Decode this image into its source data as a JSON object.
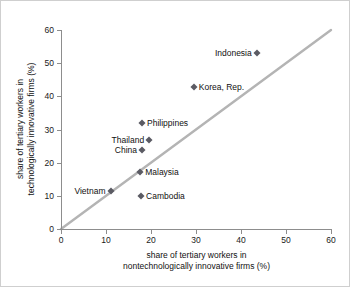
{
  "chart_data": {
    "type": "scatter",
    "title": "",
    "xlabel": "share of tertiary workers in nontechnologically innovative firms (%)",
    "xlabel_lines": [
      "share of tertiary workers in",
      "nontechnologically innovative firms (%)"
    ],
    "ylabel": "share of tertiary workers in technologically innovative firms (%)",
    "ylabel_lines": [
      "share of tertiary workers in",
      "technologically innovative firms (%)"
    ],
    "xlim": [
      0,
      60
    ],
    "ylim": [
      0,
      60
    ],
    "xticks": [
      0,
      10,
      20,
      30,
      40,
      50,
      60
    ],
    "yticks": [
      0,
      10,
      20,
      30,
      40,
      50,
      60
    ],
    "xtick_labels": [
      "0",
      "10",
      "20",
      "30",
      "40",
      "50",
      "60"
    ],
    "ytick_labels": [
      "0",
      "10",
      "20",
      "30",
      "40",
      "50",
      "60"
    ],
    "grid": false,
    "legend": "none",
    "marker_color": "#5b5b63",
    "reference_line": {
      "name": "45-degree-line",
      "from": [
        0,
        0
      ],
      "to": [
        60,
        60
      ],
      "color": "#b4b4b4",
      "slope": 1,
      "intercept": 0
    },
    "points": [
      {
        "label": "Indonesia",
        "x": 43.5,
        "y": 53.0,
        "label_side": "left"
      },
      {
        "label": "Korea, Rep.",
        "x": 29.5,
        "y": 42.8,
        "label_side": "right"
      },
      {
        "label": "Philippines",
        "x": 18.0,
        "y": 31.9,
        "label_side": "right"
      },
      {
        "label": "Thailand",
        "x": 19.6,
        "y": 26.8,
        "label_side": "left"
      },
      {
        "label": "China",
        "x": 18.0,
        "y": 23.8,
        "label_side": "left"
      },
      {
        "label": "Malaysia",
        "x": 17.6,
        "y": 17.1,
        "label_side": "right"
      },
      {
        "label": "Vietnam",
        "x": 11.0,
        "y": 11.6,
        "label_side": "left"
      },
      {
        "label": "Cambodia",
        "x": 17.8,
        "y": 9.8,
        "label_side": "right"
      }
    ]
  }
}
